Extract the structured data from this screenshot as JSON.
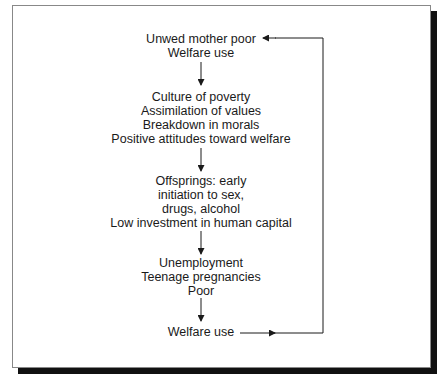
{
  "diagram": {
    "type": "flowchart-cycle",
    "nodes": [
      {
        "id": "start",
        "lines": [
          "Unwed mother poor",
          "Welfare use"
        ]
      },
      {
        "id": "culture",
        "lines": [
          "Culture of poverty",
          "Assimilation of values",
          "Breakdown in morals",
          "Positive attitudes toward welfare"
        ]
      },
      {
        "id": "offspring",
        "lines": [
          "Offsprings:  early",
          "initiation to sex,",
          "drugs, alcohol",
          "Low investment in human capital"
        ]
      },
      {
        "id": "outcomes",
        "lines": [
          "Unemployment",
          "Teenage pregnancies",
          "Poor"
        ]
      },
      {
        "id": "end",
        "lines": [
          "Welfare use"
        ]
      }
    ],
    "edges": [
      {
        "from": "start",
        "to": "culture"
      },
      {
        "from": "culture",
        "to": "offspring"
      },
      {
        "from": "offspring",
        "to": "outcomes"
      },
      {
        "from": "outcomes",
        "to": "end"
      },
      {
        "from": "end",
        "to": "start",
        "style": "feedback-loop-right"
      }
    ],
    "colors": {
      "ink": "#1a1a1a",
      "frame_border": "#888888",
      "shadow": "#111111",
      "background": "#ffffff"
    }
  }
}
